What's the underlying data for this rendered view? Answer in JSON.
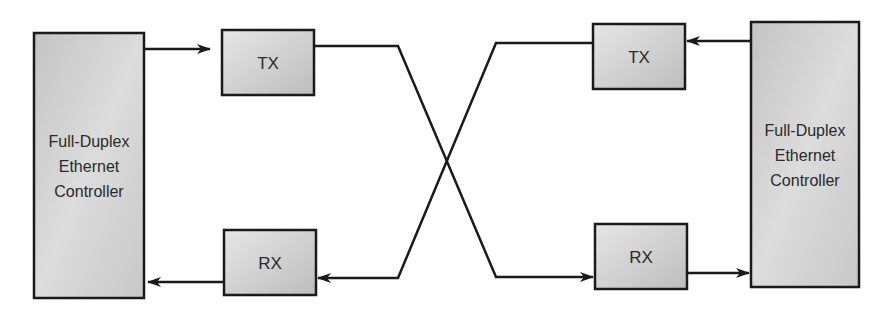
{
  "diagram": {
    "type": "full-duplex-ethernet-crossover",
    "colors": {
      "stroke": "#1a1a1a",
      "box_fill_light": "#e4e4e4",
      "box_fill_dark": "#b9b9b9",
      "text": "#2a2a2a",
      "background": "#ffffff"
    },
    "left_controller": {
      "lines": [
        "Full-Duplex",
        "Ethernet",
        "Controller"
      ]
    },
    "right_controller": {
      "lines": [
        "Full-Duplex",
        "Ethernet",
        "Controller"
      ]
    },
    "left_tx": {
      "label": "TX"
    },
    "left_rx": {
      "label": "RX"
    },
    "right_tx": {
      "label": "TX"
    },
    "right_rx": {
      "label": "RX"
    },
    "connections": [
      {
        "from": "left_controller",
        "to": "left_tx"
      },
      {
        "from": "left_tx",
        "to": "right_rx",
        "crossover": true
      },
      {
        "from": "right_rx",
        "to": "right_controller"
      },
      {
        "from": "right_controller",
        "to": "right_tx"
      },
      {
        "from": "right_tx",
        "to": "left_rx",
        "crossover": true
      },
      {
        "from": "left_rx",
        "to": "left_controller"
      }
    ]
  }
}
